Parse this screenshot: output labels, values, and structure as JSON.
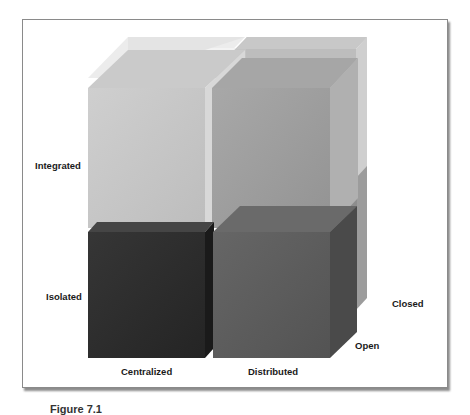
{
  "figure": {
    "type": "3d-cube-matrix",
    "axes": {
      "vertical": [
        "Integrated",
        "Isolated"
      ],
      "horizontal": [
        "Centralized",
        "Distributed"
      ],
      "depth": [
        "Open",
        "Closed"
      ]
    },
    "labels": {
      "integrated": "Integrated",
      "isolated": "Isolated",
      "centralized": "Centralized",
      "distributed": "Distributed",
      "open": "Open",
      "closed": "Closed"
    },
    "cubes": [
      {
        "position": "back-top-left",
        "layer": "Closed",
        "row": "Integrated",
        "col": "Centralized",
        "color": "#e2e2e2"
      },
      {
        "position": "back-top-right",
        "layer": "Closed",
        "row": "Integrated",
        "col": "Distributed",
        "color": "#b4b4b4"
      },
      {
        "position": "back-bottom-right",
        "layer": "Closed",
        "row": "Isolated",
        "col": "Distributed",
        "color": "#8a8a8a"
      },
      {
        "position": "front-top-left",
        "layer": "Open",
        "row": "Integrated",
        "col": "Centralized",
        "color": "#c4c4c4"
      },
      {
        "position": "front-top-right",
        "layer": "Open",
        "row": "Integrated",
        "col": "Distributed",
        "color": "#9a9a9a"
      },
      {
        "position": "front-bottom-left",
        "layer": "Open",
        "row": "Isolated",
        "col": "Centralized",
        "color": "#2c2c2c"
      },
      {
        "position": "front-bottom-right",
        "layer": "Open",
        "row": "Isolated",
        "col": "Distributed",
        "color": "#5a5a5a"
      }
    ],
    "caption": "Figure 7.1"
  }
}
